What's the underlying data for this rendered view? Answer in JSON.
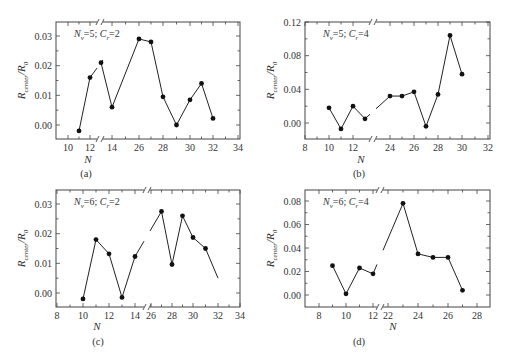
{
  "figure": {
    "panels": [
      "a",
      "b",
      "c",
      "d"
    ]
  },
  "chart_data": [
    {
      "id": "a",
      "type": "line",
      "panel_label": "(a)",
      "annotation": {
        "n_label": "N",
        "n_sub": "v",
        "n_val": "=5; ",
        "c_label": "C",
        "c_sub": "r",
        "c_val": "=2"
      },
      "xlabel": "N",
      "ylabel_main": "R",
      "ylabel_sub": "center",
      "ylabel_den": "/R",
      "ylabel_den_sub": "0",
      "x_ticks": [
        "10",
        "12",
        "14",
        "26",
        "28",
        "30",
        "32",
        "34"
      ],
      "y_ticks": [
        "0.00",
        "0.01",
        "0.02",
        "0.03"
      ],
      "axis_break": true,
      "x": [
        11,
        12,
        13,
        14,
        26,
        27,
        28,
        29,
        30,
        31,
        32
      ],
      "values": [
        -0.002,
        0.016,
        0.021,
        0.006,
        0.029,
        0.028,
        0.0095,
        0.0,
        0.0085,
        0.014,
        0.0022
      ],
      "ylim": [
        -0.005,
        0.034
      ]
    },
    {
      "id": "b",
      "type": "line",
      "panel_label": "(b)",
      "annotation": {
        "n_label": "N",
        "n_sub": "v",
        "n_val": "=5; ",
        "c_label": "C",
        "c_sub": "r",
        "c_val": "=4"
      },
      "xlabel": "N",
      "ylabel_main": "R",
      "ylabel_sub": "center",
      "ylabel_den": "/R",
      "ylabel_den_sub": "0",
      "x_ticks": [
        "8",
        "10",
        "12",
        "24",
        "26",
        "28",
        "30",
        "32"
      ],
      "y_ticks": [
        "0.00",
        "0.04",
        "0.08",
        "0.12"
      ],
      "axis_break": true,
      "x": [
        10,
        11,
        12,
        13,
        24,
        25,
        26,
        27,
        28,
        29,
        30
      ],
      "values": [
        0.018,
        -0.007,
        0.02,
        0.005,
        0.032,
        0.032,
        0.037,
        -0.004,
        0.034,
        0.104,
        0.058
      ],
      "ylim": [
        -0.02,
        0.12
      ]
    },
    {
      "id": "c",
      "type": "line",
      "panel_label": "(c)",
      "annotation": {
        "n_label": "N",
        "n_sub": "v",
        "n_val": "=6; ",
        "c_label": "C",
        "c_sub": "r",
        "c_val": "=2"
      },
      "xlabel": "N",
      "ylabel_main": "R",
      "ylabel_sub": "center",
      "ylabel_den": "/R",
      "ylabel_den_sub": "0",
      "x_ticks": [
        "8",
        "10",
        "12",
        "14",
        "26",
        "28",
        "30",
        "32",
        "34"
      ],
      "y_ticks": [
        "0.00",
        "0.01",
        "0.02",
        "0.03"
      ],
      "axis_break": true,
      "x": [
        10,
        11,
        12,
        13,
        14,
        27,
        28,
        29,
        30,
        31
      ],
      "values": [
        -0.002,
        0.018,
        0.0132,
        -0.0015,
        0.0123,
        0.0275,
        0.0096,
        0.026,
        0.0187,
        0.015
      ],
      "trailing_line_to": [
        32,
        0.005
      ],
      "ylim": [
        -0.005,
        0.034
      ]
    },
    {
      "id": "d",
      "type": "line",
      "panel_label": "(d)",
      "annotation": {
        "n_label": "N",
        "n_sub": "v",
        "n_val": "=6; ",
        "c_label": "C",
        "c_sub": "r",
        "c_val": "=4"
      },
      "xlabel": "N",
      "ylabel_main": "R",
      "ylabel_sub": "center",
      "ylabel_den": "/R",
      "ylabel_den_sub": "0",
      "x_ticks": [
        "8",
        "10",
        "12",
        "22",
        "24",
        "26",
        "28"
      ],
      "y_ticks": [
        "0.00",
        "0.02",
        "0.04",
        "0.06",
        "0.08"
      ],
      "axis_break": true,
      "x": [
        9,
        10,
        11,
        12,
        23,
        24,
        25,
        26,
        27
      ],
      "values": [
        0.025,
        0.001,
        0.023,
        0.018,
        0.078,
        0.035,
        0.032,
        0.032,
        0.004
      ],
      "ylim": [
        -0.009,
        0.088
      ]
    }
  ]
}
